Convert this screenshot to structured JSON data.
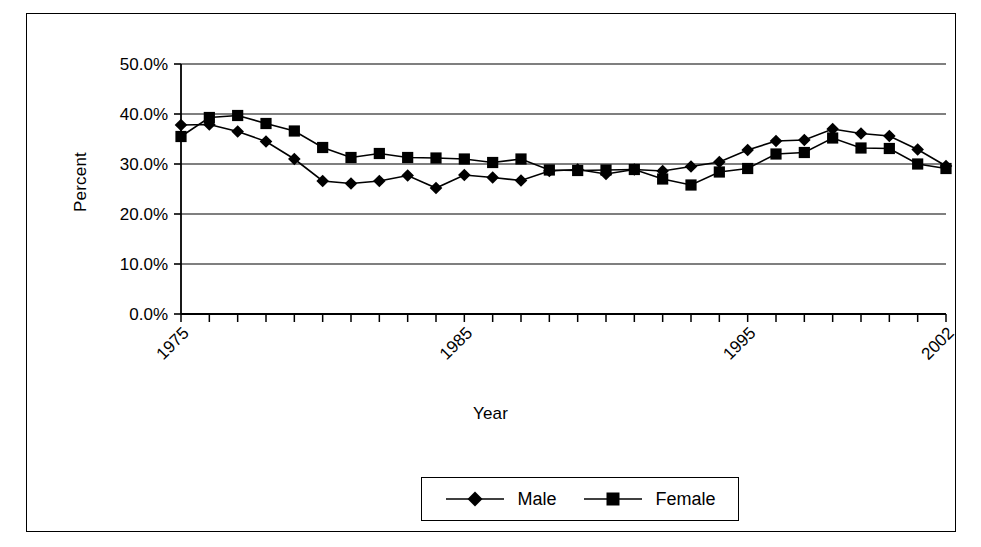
{
  "chart_data": {
    "type": "line",
    "title": "",
    "xlabel": "Year",
    "ylabel": "Percent",
    "x": [
      1975,
      1976,
      1977,
      1978,
      1979,
      1980,
      1981,
      1982,
      1983,
      1984,
      1985,
      1986,
      1987,
      1988,
      1989,
      1990,
      1991,
      1992,
      1993,
      1994,
      1995,
      1996,
      1997,
      1998,
      1999,
      2000,
      2001,
      2002
    ],
    "x_tick_labels": [
      "1975",
      "1985",
      "1995",
      "2002"
    ],
    "x_tick_label_values": [
      1975,
      1985,
      1995,
      2002
    ],
    "xlim": [
      1975,
      2002
    ],
    "y_tick_labels": [
      "0.0%",
      "10.0%",
      "20.0%",
      "30.0%",
      "40.0%",
      "50.0%"
    ],
    "y_tick_values": [
      0,
      10,
      20,
      30,
      40,
      50
    ],
    "ylim": [
      0,
      50
    ],
    "grid": "horizontal",
    "legend_position": "bottom",
    "series": [
      {
        "name": "Male",
        "marker": "diamond",
        "color": "#000000",
        "values": [
          37.8,
          37.9,
          36.5,
          34.5,
          31.0,
          26.6,
          26.1,
          26.6,
          27.7,
          25.2,
          27.8,
          27.3,
          26.7,
          28.6,
          28.9,
          28.0,
          28.9,
          28.6,
          29.5,
          30.4,
          32.8,
          34.6,
          34.8,
          37.0,
          36.1,
          35.6,
          32.9,
          29.6
        ]
      },
      {
        "name": "Female",
        "marker": "square",
        "color": "#000000",
        "values": [
          35.5,
          39.3,
          39.7,
          38.1,
          36.6,
          33.3,
          31.3,
          32.1,
          31.3,
          31.2,
          31.0,
          30.3,
          31.0,
          28.8,
          28.7,
          28.8,
          28.9,
          27.0,
          25.8,
          28.4,
          29.1,
          32.0,
          32.3,
          35.2,
          33.2,
          33.1,
          30.0,
          29.1
        ]
      }
    ]
  },
  "legend": {
    "entries": [
      {
        "label": "Male",
        "marker": "diamond-marker-icon"
      },
      {
        "label": "Female",
        "marker": "square-marker-icon"
      }
    ]
  },
  "axes": {
    "y_title": "Percent",
    "x_title": "Year"
  }
}
